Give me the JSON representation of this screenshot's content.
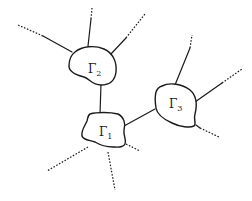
{
  "diagram": {
    "type": "graph of regions",
    "nodes": [
      {
        "id": "gamma2",
        "label": "Γ",
        "subscript": "2"
      },
      {
        "id": "gamma1",
        "label": "Γ",
        "subscript": "1"
      },
      {
        "id": "gamma3",
        "label": "Γ",
        "subscript": "3"
      }
    ],
    "edges": [
      {
        "from": "gamma2",
        "to": "gamma1",
        "style": "solid"
      },
      {
        "from": "gamma1",
        "to": "gamma3",
        "style": "solid"
      }
    ],
    "external_stubs": [
      {
        "node": "gamma2",
        "count": 3
      },
      {
        "node": "gamma3",
        "count": 3
      },
      {
        "node": "gamma1",
        "count": 3
      }
    ],
    "colors": {
      "stroke": "#1a1a1a",
      "background": "#ffffff"
    }
  }
}
